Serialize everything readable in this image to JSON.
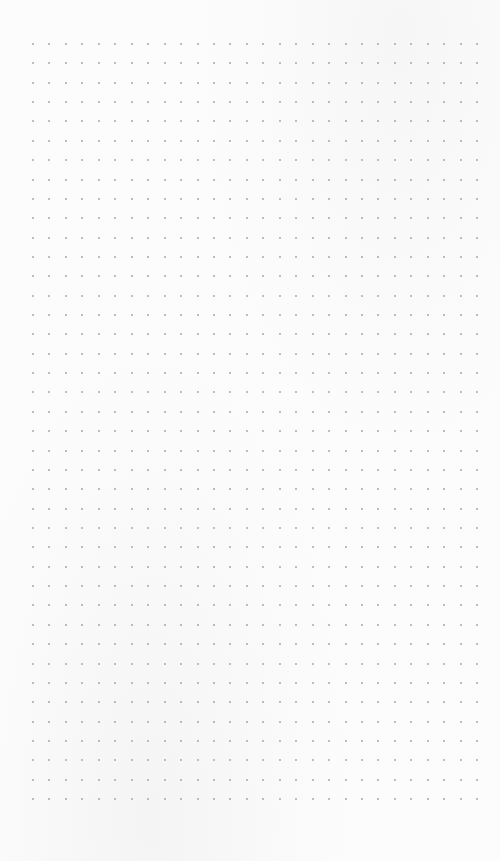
{
  "page": {
    "type": "dot-grid-paper",
    "background": "#fcfcfc",
    "dot_color": "#a8a8a8"
  },
  "grid": {
    "columns": 28,
    "rows": 40,
    "origin_x": 33,
    "origin_y": 44,
    "spacing_x": 16.45,
    "spacing_y": 19.36
  }
}
